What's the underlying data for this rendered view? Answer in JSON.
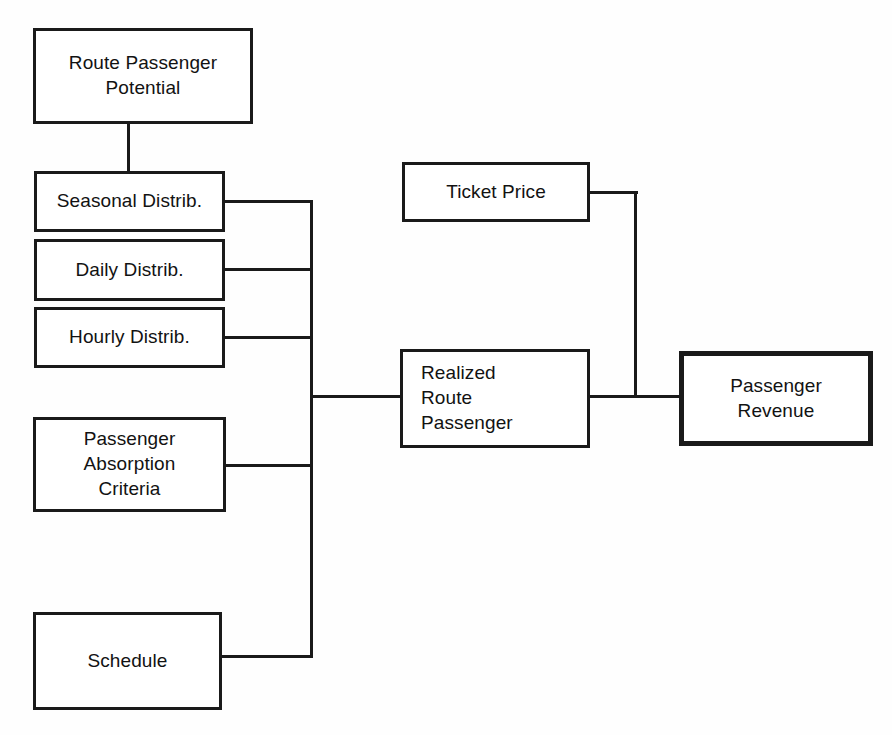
{
  "diagram": {
    "background_color": "#fefefe",
    "line_color": "#1a1a1a",
    "text_color": "#121212",
    "nodes": [
      {
        "id": "route-passenger-potential",
        "label": "Route Passenger\nPotential",
        "emphasis": false,
        "align": "center"
      },
      {
        "id": "seasonal-distrib",
        "label": "Seasonal Distrib.",
        "emphasis": false,
        "align": "center"
      },
      {
        "id": "daily-distrib",
        "label": "Daily Distrib.",
        "emphasis": false,
        "align": "center"
      },
      {
        "id": "hourly-distrib",
        "label": "Hourly Distrib.",
        "emphasis": false,
        "align": "center"
      },
      {
        "id": "passenger-absorption-criteria",
        "label": "Passenger\nAbsorption\nCriteria",
        "emphasis": false,
        "align": "center"
      },
      {
        "id": "schedule",
        "label": "Schedule",
        "emphasis": false,
        "align": "center"
      },
      {
        "id": "ticket-price",
        "label": "Ticket Price",
        "emphasis": false,
        "align": "center"
      },
      {
        "id": "realized-route-passenger",
        "label": "Realized\nRoute\nPassenger",
        "emphasis": false,
        "align": "left"
      },
      {
        "id": "passenger-revenue",
        "label": "Passenger\nRevenue",
        "emphasis": true,
        "align": "center"
      }
    ],
    "edges": [
      {
        "from": "route-passenger-potential",
        "to": "seasonal-distrib"
      },
      {
        "from": "seasonal-distrib",
        "to": "realized-route-passenger"
      },
      {
        "from": "daily-distrib",
        "to": "realized-route-passenger"
      },
      {
        "from": "hourly-distrib",
        "to": "realized-route-passenger"
      },
      {
        "from": "passenger-absorption-criteria",
        "to": "realized-route-passenger"
      },
      {
        "from": "schedule",
        "to": "realized-route-passenger"
      },
      {
        "from": "ticket-price",
        "to": "passenger-revenue"
      },
      {
        "from": "realized-route-passenger",
        "to": "passenger-revenue"
      }
    ]
  }
}
